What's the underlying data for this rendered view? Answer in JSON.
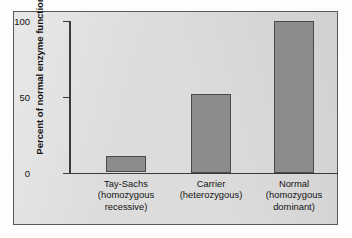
{
  "chart_data": {
    "type": "bar",
    "title": "",
    "subtitle": "",
    "xlabel": "",
    "ylabel": "Percent of normal enzyme function",
    "categories": [
      "Tay-Sachs (homozygous recessive)",
      "Carrier (heterozygous)",
      "Normal (homozygous dominant)"
    ],
    "category_lines": [
      [
        "Tay-Sachs",
        "(homozygous",
        "recessive)"
      ],
      [
        "Carrier",
        "(heterozygous)"
      ],
      [
        "Normal",
        "(homozygous",
        "dominant)"
      ]
    ],
    "values": [
      11,
      52,
      100
    ],
    "ylim": [
      0,
      105
    ],
    "yticks": [
      0,
      50,
      100
    ],
    "ytick_labels": [
      "0",
      "50",
      "100"
    ],
    "grid": false,
    "legend": false,
    "bar_color": "#8c8c8c",
    "bar_edge_color": "#4a4a4c",
    "panel_color": "#dcdcdc",
    "axis_color": "#3b3b3d"
  },
  "axis": {
    "y_title": "Percent of normal enzyme function",
    "tick_0": "0",
    "tick_50": "50",
    "tick_100": "100"
  },
  "categories": [
    {
      "line1": "Tay-Sachs",
      "line2": "(homozygous",
      "line3": "recessive)"
    },
    {
      "line1": "Carrier",
      "line2": "(heterozygous)",
      "line3": ""
    },
    {
      "line1": "Normal",
      "line2": "(homozygous",
      "line3": "dominant)"
    }
  ]
}
